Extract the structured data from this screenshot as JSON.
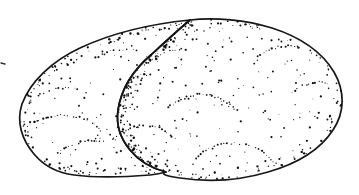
{
  "figure": {
    "kind": "line-drawing",
    "style": "pen-and-ink outline with stipple shading",
    "alt_text": "Black and white stippled line drawing of two overlapping oval potato tubers",
    "canvas": {
      "width": 359,
      "height": 195,
      "background_color": "#ffffff"
    },
    "ink": {
      "outline_color": "#161616",
      "stipple_color": "#121212",
      "tick_color": "#303030",
      "outline_width": 1.7
    },
    "parts": [
      {
        "name": "rear-tuber",
        "label": "rear tuber",
        "description": "upper-left lobe partially hidden behind the front tuber"
      },
      {
        "name": "front-tuber",
        "label": "front tuber",
        "description": "larger lower-right lobe overlapping the rear tuber"
      }
    ],
    "margin_tick": {
      "name": "left-margin-tick",
      "visible": true,
      "x": 1,
      "y": 63
    },
    "geometry": {
      "rear_outline": "M 190 20 C 150 24 110 34 80 48 C 52 61 30 82 22 104 C 16 122 22 140 34 154 C 44 166 58 173 74 175 C 96 178 126 177 150 175 C 158 174 163 173 166 172",
      "front_outline": "M 190 20 C 215 17 246 20 272 28 C 300 37 322 52 334 72 C 345 91 345 112 333 130 C 320 150 296 164 268 172 C 238 181 206 182 180 178 C 166 176 160 174 166 172 C 150 168 138 160 130 150 C 120 138 116 124 118 110 C 121 90 133 70 152 54 C 165 42 178 30 190 20 Z",
      "lobe_seam": "M 190 20 C 178 30 165 42 152 54 C 133 70 121 90 118 110 C 116 124 120 138 130 150 C 138 160 150 168 166 172"
    },
    "stipple_arcs": [
      {
        "name": "arc-upper-center",
        "path": "M 168 108 C 182 96 198 92 212 96 C 224 99 232 105 238 112"
      },
      {
        "name": "arc-left-upper",
        "path": "M 38 96 C 52 88 66 86 78 89"
      },
      {
        "name": "arc-left-mid",
        "path": "M 28 126 C 44 116 62 113 78 117 C 88 120 95 124 100 129"
      },
      {
        "name": "arc-left-lower",
        "path": "M 58 152 C 72 142 88 139 102 142"
      },
      {
        "name": "arc-center-lower",
        "path": "M 112 140 C 126 127 142 123 156 127 C 166 130 173 136 178 143"
      },
      {
        "name": "arc-bottom-center",
        "path": "M 196 158 C 212 144 232 140 250 146 C 262 150 270 157 276 165"
      },
      {
        "name": "arc-right-upper",
        "path": "M 258 56 C 272 46 288 44 300 48"
      },
      {
        "name": "arc-right-mid",
        "path": "M 292 92 C 306 82 320 80 330 84"
      },
      {
        "name": "arc-top-left",
        "path": "M 96 58 C 110 50 124 48 136 51"
      },
      {
        "name": "arc-seam-upper",
        "path": "M 150 62 C 162 52 176 48 188 50"
      }
    ],
    "stipple_density": {
      "interior_scatter_count": 230,
      "edge_band_count": 330,
      "arc_dot_spacing": 3.2
    }
  }
}
